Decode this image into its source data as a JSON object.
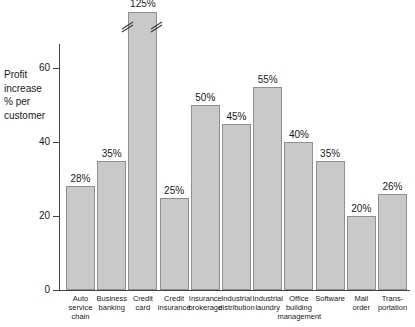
{
  "chart_data": {
    "type": "bar",
    "title": "",
    "subtitle": "",
    "xlabel": "",
    "ylabel": "Profit\nincrease\n% per\ncustomer",
    "ylim": [
      0,
      66
    ],
    "ytick_values": [
      "0",
      "20",
      "40",
      "60"
    ],
    "grid": false,
    "legend": null,
    "axis_break": {
      "category": "Credit card",
      "note": "double-slash break drawn across the bar near the top; true value 125% exceeds axis range"
    },
    "categories": [
      "Auto\nservice\nchain",
      "Business\nbanking",
      "Credit\ncard",
      "Credit\ninsurance",
      "Insurance\nbrokerage",
      "Industrial\ndistribution",
      "Industrial\nlaundry",
      "Office\nbuilding\nmanagement",
      "Software",
      "Mail\norder",
      "Trans-\nportation"
    ],
    "values": [
      28,
      35,
      125,
      25,
      50,
      45,
      55,
      40,
      35,
      20,
      26
    ],
    "value_labels": [
      "28%",
      "35%",
      "125%",
      "25%",
      "50%",
      "45%",
      "55%",
      "40%",
      "35%",
      "20%",
      "26%"
    ]
  },
  "style": {
    "bar_fill": "#c9c9c9",
    "bar_stroke": "#8f8f8f",
    "axis_color": "#444444",
    "text_color": "#1a1a1a",
    "background": "#ffffff"
  }
}
